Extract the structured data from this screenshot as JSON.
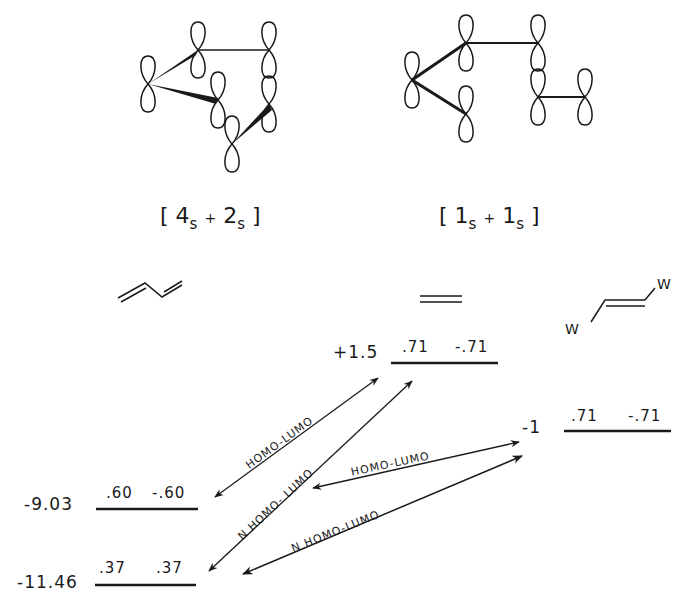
{
  "diagrams": {
    "left_bracket": {
      "open": "[",
      "a": "4",
      "a_sub": "s",
      "plus": "+",
      "b": "2",
      "b_sub": "s",
      "close": "]"
    },
    "right_bracket": {
      "open": "[",
      "a": "1",
      "a_sub": "s",
      "plus": "+",
      "b": "1",
      "b_sub": "s",
      "close": "]"
    }
  },
  "molecules": {
    "butadiene": "butadiene",
    "ethylene": "ethylene",
    "substituted_ethylene": {
      "sub1": "W",
      "sub2": "W"
    }
  },
  "levels": {
    "diene_homo": {
      "energy": "-9.03",
      "c1": ".60",
      "c2": "-.60"
    },
    "diene_nhomo": {
      "energy": "-11.46",
      "c1": ".37",
      "c2": ".37"
    },
    "ethylene_lumo": {
      "energy": "+1.5",
      "c1": ".71",
      "c2": "-.71"
    },
    "w_ethylene_lumo": {
      "energy": "-1",
      "c1": ".71",
      "c2": "-.71"
    }
  },
  "interactions": [
    {
      "label": "HOMO-LUMO"
    },
    {
      "label": "N HOMO-   LUMO"
    },
    {
      "label": "HOMO-LUMO"
    },
    {
      "label": "N HOMO-LUMO"
    }
  ]
}
